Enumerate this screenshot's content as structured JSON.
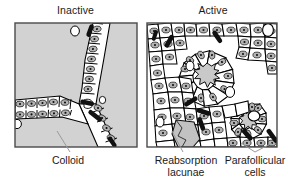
{
  "figure": {
    "type": "histology-diagram",
    "panels": [
      {
        "id": "inactive",
        "title": "Inactive",
        "position": "left",
        "description": "Large colloid-filled follicles bounded by a single layer of flattened squamous follicular cells forming a branching Y-shaped wall",
        "background_color": "#d0d0d0",
        "epithelium": "squamous / low cuboidal",
        "colloid_area": "large"
      },
      {
        "id": "active",
        "title": "Active",
        "position": "right",
        "description": "Small follicles with tall columnar follicular cells arranged in rosettes around star-shaped colloid with reabsorption lacunae",
        "background_color": "#ffffff",
        "epithelium": "columnar",
        "colloid_area": "small, scalloped"
      }
    ],
    "labels": [
      {
        "id": "colloid",
        "text": "Colloid",
        "points_to": "inactive-panel-colloid-pool",
        "leader": "single"
      },
      {
        "id": "reabsorption-lacunae",
        "line1": "Reabsorption",
        "line2": "lacunae",
        "text": "Reabsorption lacunae",
        "points_to": "active-panel-lacuna",
        "leader": "single"
      },
      {
        "id": "parafollicular-cells",
        "line1": "Parafollicular",
        "line2": "cells",
        "text": "Parafollicular cells",
        "points_to": "active-panel-clear-cells",
        "leader": "forked"
      }
    ],
    "colors": {
      "colloid_gray": "#d0d0d0",
      "cytoplasm_white": "#ffffff",
      "nucleus_gray": "#b0b0b0",
      "nucleolus_black": "#1a1a1a",
      "outline_black": "#000000",
      "border_gray": "#555555",
      "leader_line": "#8a8a8a",
      "text": "#1a1a1a"
    }
  }
}
